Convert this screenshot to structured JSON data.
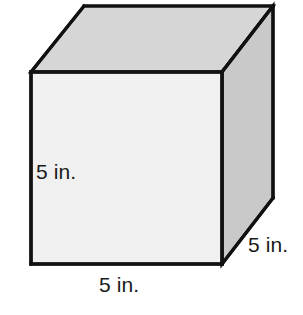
{
  "figure": {
    "name": "cube-net-diagram",
    "shape": "cube",
    "unit": "in.",
    "edge_length": 5,
    "background_color": "#ffffff",
    "stroke_color": "#111111"
  },
  "faces": {
    "front": {
      "name": "front-face",
      "fill": "#f0f0f0",
      "points": "31,72 222,72 222,264 31,264"
    },
    "top": {
      "name": "top-face",
      "fill": "#d6d6d6",
      "points": "31,72 84,6 273,6 222,72"
    },
    "right": {
      "name": "right-face",
      "fill": "#c9c9c9",
      "points": "222,72 273,6 273,198 222,264"
    }
  },
  "labels": {
    "height": "5 in.",
    "width": "5 in.",
    "depth": "5 in."
  }
}
